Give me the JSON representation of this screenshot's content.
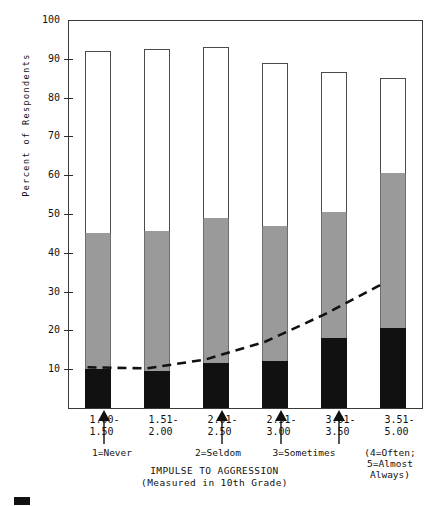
{
  "chart_data": {
    "type": "bar",
    "subtype": "stacked-bar-with-trend-line",
    "title": "",
    "xlabel": "IMPULSE TO AGGRESSION (Measured in 10th Grade)",
    "ylabel": "Percent of Respondents",
    "ylim": [
      0,
      100
    ],
    "yticks": [
      0,
      10,
      20,
      30,
      40,
      50,
      60,
      70,
      80,
      90,
      100
    ],
    "ytick_labels": [
      "",
      "10",
      "20",
      "30",
      "40",
      "50",
      "60",
      "70",
      "80",
      "90",
      "100"
    ],
    "grid": false,
    "legend_position": "bottom-left",
    "categories": [
      "1.00-\n1.50",
      "1.51-\n2.00",
      "2.01-\n2.50",
      "2.51-\n3.00",
      "3.01-\n3.50",
      "3.51-\n5.00"
    ],
    "series": [
      {
        "name": "black-segment",
        "color": "#111111",
        "values": [
          10,
          9.5,
          11.5,
          12,
          18,
          20.5
        ]
      },
      {
        "name": "gray-segment",
        "color": "#9a9a9a",
        "values": [
          35,
          36,
          37.5,
          35,
          32.5,
          40
        ]
      },
      {
        "name": "white-segment",
        "color": "#ffffff",
        "values": [
          47,
          47,
          44,
          42,
          36,
          24.5
        ]
      }
    ],
    "cumulative_tops": {
      "black": [
        10,
        9.5,
        11.5,
        12,
        18,
        20.5
      ],
      "gray": [
        45,
        45.5,
        49,
        47,
        50.5,
        60.5
      ],
      "white": [
        92,
        92.5,
        93,
        89,
        86.5,
        85
      ]
    },
    "trend_line": {
      "name": "trend",
      "style": "dashed",
      "color": "#111111",
      "values": [
        10.5,
        10.2,
        12.5,
        17.0,
        24.0,
        32.0
      ]
    }
  },
  "axis": {
    "y_title": "Percent of Respondents",
    "x_title_line1": "IMPULSE TO AGGRESSION",
    "x_title_line2": "(Measured in 10th Grade)"
  },
  "anchors": [
    {
      "label": "1=Never"
    },
    {
      "label": "2=Seldom"
    },
    {
      "label": "3=Sometimes"
    },
    {
      "label": "(4=Often;\n5=Almost\nAlways)"
    }
  ],
  "legend": {
    "items": [
      {
        "swatch_color": "#111111",
        "label": ""
      }
    ]
  },
  "colors": {
    "black_segment": "#111111",
    "gray_segment": "#9a9a9a",
    "white_segment": "#ffffff",
    "axis": "#3a3a3a",
    "text": "#111111"
  }
}
